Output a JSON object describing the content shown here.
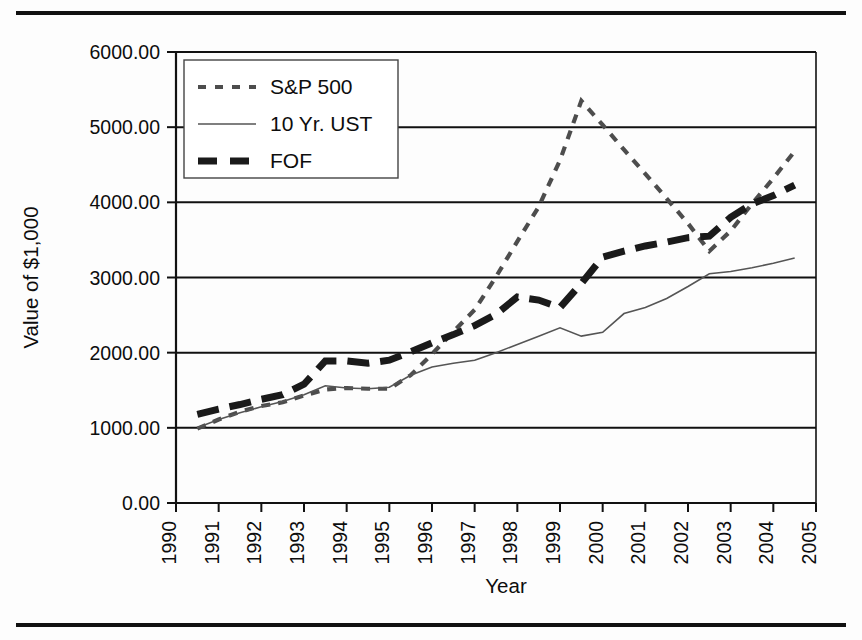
{
  "figure": {
    "top_rule": "horizontal-rule",
    "bottom_rule": "horizontal-rule"
  },
  "chart_data": {
    "type": "line",
    "title": "",
    "xlabel": "Year",
    "ylabel": "Value of $1,000",
    "xlim": [
      1990,
      2005
    ],
    "ylim": [
      0,
      6000
    ],
    "grid": "horizontal",
    "legend_position": "top-left",
    "x_tick_labels": [
      "1990",
      "1991",
      "1992",
      "1993",
      "1994",
      "1995",
      "1996",
      "1997",
      "1998",
      "1999",
      "2000",
      "2001",
      "2002",
      "2003",
      "2004",
      "2005"
    ],
    "y_tick_labels": [
      "0.00",
      "1000.00",
      "2000.00",
      "3000.00",
      "4000.00",
      "5000.00",
      "6000.00"
    ],
    "y_ticks": [
      0,
      1000,
      2000,
      3000,
      4000,
      5000,
      6000
    ],
    "x": [
      1990.5,
      1991.0,
      1991.5,
      1992.0,
      1992.5,
      1993.0,
      1993.5,
      1994.0,
      1994.5,
      1995.0,
      1995.5,
      1996.0,
      1996.5,
      1997.0,
      1997.5,
      1998.0,
      1998.5,
      1999.0,
      1999.5,
      2000.0,
      2000.5,
      2001.0,
      2001.5,
      2002.0,
      2002.5,
      2003.0,
      2003.5,
      2004.0,
      2004.5
    ],
    "series": [
      {
        "name": "S&P 500",
        "style": "dashed-thin",
        "color": "#4d4d4d",
        "values": [
          990,
          1110,
          1215,
          1290,
          1340,
          1430,
          1510,
          1530,
          1520,
          1520,
          1700,
          1980,
          2280,
          2570,
          3010,
          3480,
          3940,
          4560,
          5350,
          5030,
          4700,
          4380,
          4050,
          3720,
          3350,
          3620,
          3980,
          4320,
          4680
        ]
      },
      {
        "name": "10 Yr. UST",
        "style": "solid-thin",
        "color": "#555555",
        "values": [
          1000,
          1110,
          1200,
          1280,
          1350,
          1440,
          1560,
          1530,
          1520,
          1540,
          1700,
          1810,
          1860,
          1900,
          2000,
          2110,
          2220,
          2330,
          2220,
          2270,
          2520,
          2600,
          2720,
          2880,
          3050,
          3080,
          3130,
          3190,
          3260
        ]
      },
      {
        "name": "FOF",
        "style": "dashed-thick",
        "color": "#1a1a1a",
        "values": [
          1180,
          1250,
          1310,
          1380,
          1440,
          1580,
          1890,
          1890,
          1860,
          1900,
          2010,
          2130,
          2240,
          2360,
          2510,
          2740,
          2700,
          2600,
          2920,
          3270,
          3350,
          3420,
          3470,
          3530,
          3550,
          3800,
          3980,
          4090,
          4230
        ]
      }
    ]
  }
}
